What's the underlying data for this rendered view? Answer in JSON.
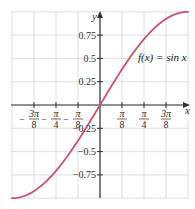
{
  "chart_data": {
    "type": "line",
    "title": "",
    "function_label": "f(x) = sin x",
    "xlabel": "x",
    "ylabel": "y",
    "xlim": [
      -1.5708,
      1.5708
    ],
    "ylim": [
      -1,
      1
    ],
    "grid": true,
    "x_ticks": [
      {
        "value": -1.1781,
        "num": "3π",
        "den": "8",
        "neg": true
      },
      {
        "value": -0.7854,
        "num": "π",
        "den": "4",
        "neg": true
      },
      {
        "value": -0.3927,
        "num": "π",
        "den": "8",
        "neg": true
      },
      {
        "value": 0.3927,
        "num": "π",
        "den": "8",
        "neg": false
      },
      {
        "value": 0.7854,
        "num": "π",
        "den": "4",
        "neg": false
      },
      {
        "value": 1.1781,
        "num": "3π",
        "den": "8",
        "neg": false
      }
    ],
    "y_ticks": [
      {
        "value": 0.75,
        "label": "0.75"
      },
      {
        "value": 0.5,
        "label": "0.5"
      },
      {
        "value": 0.25,
        "label": "0.25"
      },
      {
        "value": -0.25,
        "label": "−0.25"
      },
      {
        "value": -0.5,
        "label": "−0.5"
      },
      {
        "value": -0.75,
        "label": "−0.75"
      }
    ],
    "series": [
      {
        "name": "f(x) = sin x",
        "function": "sin",
        "x_range": [
          -1.5708,
          1.5708
        ],
        "color": "#d0506a"
      }
    ]
  },
  "colors": {
    "grid": "#d8d8d8",
    "axis": "#333333",
    "curve": "#d0506a"
  }
}
